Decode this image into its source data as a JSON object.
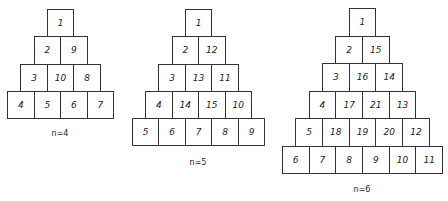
{
  "pyramids": [
    {
      "label": "n=4",
      "rows": [
        [
          "1"
        ],
        [
          "2",
          "9"
        ],
        [
          "3",
          "10",
          "8"
        ],
        [
          "4",
          "5",
          "6",
          "7"
        ]
      ]
    },
    {
      "label": "n=5",
      "rows": [
        [
          "1"
        ],
        [
          "2",
          "12"
        ],
        [
          "3",
          "13",
          "11"
        ],
        [
          "4",
          "14",
          "15",
          "10"
        ],
        [
          "5",
          "6",
          "7",
          "8",
          "9"
        ]
      ]
    },
    {
      "label": "n=6",
      "rows": [
        [
          "1"
        ],
        [
          "2",
          "15"
        ],
        [
          "3",
          "16",
          "14"
        ],
        [
          "4",
          "17",
          "21",
          "13"
        ],
        [
          "5",
          "18",
          "19",
          "20",
          "12"
        ],
        [
          "6",
          "7",
          "8",
          "9",
          "10",
          "11"
        ]
      ]
    }
  ],
  "colors": {
    "border": "#333333",
    "text": "#222222",
    "background": "#ffffff"
  }
}
